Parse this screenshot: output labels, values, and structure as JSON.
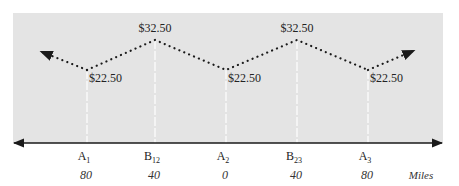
{
  "diagram": {
    "title": "",
    "unit_label": "Miles",
    "colors": {
      "panel": "#e4e4e4",
      "axis": "#1a1a1a",
      "price_line": "#1a1a1a",
      "guide_line": "#ffffff"
    },
    "locations": [
      {
        "id": "A1",
        "base": "A",
        "sub": "1",
        "distance": "80",
        "price": "$22.50",
        "level": "low"
      },
      {
        "id": "B12",
        "base": "B",
        "sub": "12",
        "distance": "40",
        "price": "$32.50",
        "level": "high"
      },
      {
        "id": "A2",
        "base": "A",
        "sub": "2",
        "distance": "0",
        "price": "$22.50",
        "level": "low"
      },
      {
        "id": "B23",
        "base": "B",
        "sub": "23",
        "distance": "40",
        "price": "$32.50",
        "level": "high"
      },
      {
        "id": "A3",
        "base": "A",
        "sub": "3",
        "distance": "80",
        "price": "$22.50",
        "level": "low"
      }
    ],
    "line_style": "dotted",
    "axis_arrows": "both-ends",
    "price_line_arrows": "both-ends"
  }
}
